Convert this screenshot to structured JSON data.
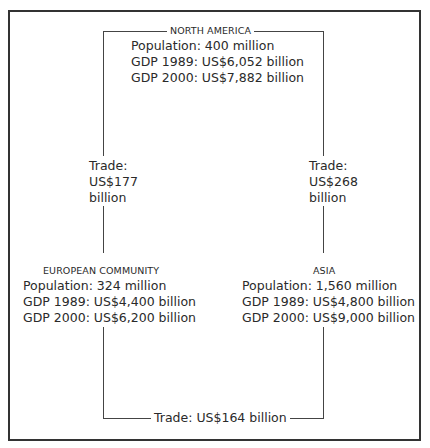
{
  "regions": {
    "north_america": {
      "title": "NORTH AMERICA",
      "population": "Population: 400 million",
      "gdp_1989": "GDP 1989: US$6,052 billion",
      "gdp_2000": "GDP 2000: US$7,882 billion"
    },
    "european_community": {
      "title": "EUROPEAN COMMUNITY",
      "population": "Population: 324 million",
      "gdp_1989": "GDP 1989: US$4,400 billion",
      "gdp_2000": "GDP 2000: US$6,200 billion"
    },
    "asia": {
      "title": "ASIA",
      "population": "Population: 1,560 million",
      "gdp_1989": "GDP 1989: US$4,800 billion",
      "gdp_2000": "GDP 2000: US$9,000 billion"
    }
  },
  "trade_links": {
    "na_ec": {
      "line1": "Trade:",
      "line2": "US$177",
      "line3": "billion"
    },
    "na_asia": {
      "line1": "Trade:",
      "line2": "US$268",
      "line3": "billion"
    },
    "ec_asia": {
      "label": "Trade: US$164 billion"
    }
  }
}
